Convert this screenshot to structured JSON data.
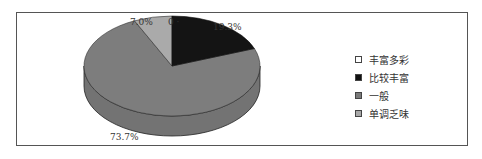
{
  "chart_data": {
    "type": "pie",
    "style": "3d",
    "title": "",
    "categories": [
      "丰富多彩",
      "比较丰富",
      "一般",
      "单调乏味"
    ],
    "values": [
      0,
      19.3,
      73.7,
      7.0
    ],
    "labels": [
      "0",
      "19.3%",
      "73.7%",
      "7.0%"
    ],
    "colors": [
      "#ffffff",
      "#111111",
      "#7a7a7a",
      "#a8a8a8"
    ],
    "legend_position": "right"
  },
  "labels": {
    "zero": "0",
    "bijiao": "19.3%",
    "yiban": "73.7%",
    "dandiao": "7.0%"
  },
  "legend": [
    {
      "label": "丰富多彩",
      "color": "#ffffff"
    },
    {
      "label": "比较丰富",
      "color": "#111111"
    },
    {
      "label": "一般",
      "color": "#7a7a7a"
    },
    {
      "label": "单调乏味",
      "color": "#a8a8a8"
    }
  ]
}
